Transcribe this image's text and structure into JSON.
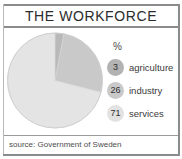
{
  "header": {
    "title": "THE WORKFORCE"
  },
  "legend": {
    "unit_label": "%",
    "items": [
      {
        "value": "3",
        "label": "agriculture",
        "color": "#b3b3b3"
      },
      {
        "value": "26",
        "label": "industry",
        "color": "#c9c9c9"
      },
      {
        "value": "71",
        "label": "services",
        "color": "#e2e2e2"
      }
    ]
  },
  "footer": {
    "source": "source: Government of Sweden"
  },
  "chart_data": {
    "type": "pie",
    "title": "THE WORKFORCE",
    "unit": "%",
    "categories": [
      "agriculture",
      "industry",
      "services"
    ],
    "values": [
      3,
      26,
      71
    ],
    "colors": [
      "#b9b9b9",
      "#c9c9c9",
      "#e4e4e4"
    ],
    "start_angle_deg": 0,
    "direction": "clockwise",
    "legend_position": "right",
    "grid": false,
    "source": "source: Government of Sweden"
  }
}
